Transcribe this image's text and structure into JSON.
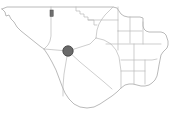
{
  "map": {
    "title": "Locator map",
    "type": "administrative-boundary-locator-map",
    "width": 171,
    "height": 118,
    "background_color": "#ffffff",
    "boundary_color": "#b9b9b9",
    "outer_boundary_color": "#a8a8a8",
    "marker_dot": {
      "name": "highlighted-location-dot",
      "color": "#6a6a6a",
      "outline_color": "#3d3d3d",
      "cx": 68,
      "cy": 51,
      "r": 5.2
    },
    "marker_rect": {
      "name": "highlighted-location-rect",
      "color": "#6f6f6f",
      "outline_color": "#4a4a4a",
      "x": 50,
      "y": 10,
      "width": 3.2,
      "height": 6.4
    },
    "outer_outline": "M 2,9 L 5,12 L 6,16 L 9,15 L 11,19 L 14,22 L 17,27 L 21,31 L 26,35 L 31,39 L 36,43 L 41,47 L 44,49 L 48,55 L 52,62 L 56,70 L 59,78 L 62,86 L 65,93 L 69,99 L 74,104 L 80,107 L 87,108 L 94,107 L 100,104 L 106,100 L 112,96 L 117,92 L 121,88 L 125,85 L 129,84 L 133,84 L 137,85 L 141,86 L 145,86 L 149,85 L 152,83 L 155,80 L 157,76 L 158,71 L 159,65 L 160,60 L 161,55 L 163,52 L 165,50 L 167,48 L 168,45 L 168,41 L 167,38 L 166,35 L 164,33 L 161,32 L 158,32 L 155,32 L 152,32 L 149,32 L 146,31 L 144,29 L 143,26 L 143,22 L 143,18 L 140,17 L 136,17 L 132,17 L 128,17 L 124,16 L 121,14 L 119,11 L 117,8 L 113,7 L 108,7 L 102,7 L 96,7 L 90,7 L 84,7 L 78,7 L 72,7 L 66,7 L 60,7 L 54,7 L 48,7 L 42,7 L 36,7 L 30,7 L 24,7 L 18,7 L 12,7 L 7,7 L 2,9 Z",
    "internal_boundaries": [
      "M 51,7 L 51,36 L 50,41 L 48,45 L 45,48 L 44,49",
      "M 44,49 L 68,51 L 90,44 L 96,38",
      "M 68,51 L 66,62 L 64,74 L 63,86 L 63,96",
      "M 68,51 L 80,62 L 92,72 L 104,82 L 112,89",
      "M 96,38 L 97,30 L 99,24 L 102,19 L 105,15 L 108,12 L 111,9 L 113,7",
      "M 96,38 L 104,40 L 111,44 L 116,50 L 119,57 L 120,64 L 121,71 L 121,78 L 121,84 L 121,88",
      "M 76,7 L 76,11 L 80,11 L 80,14 L 84,14 L 84,17 L 88,17 L 88,20 L 94,20 L 94,25 L 97,25",
      "M 88,20 L 94,20 L 100,20 L 106,20 L 112,20 L 118,20",
      "M 118,7 L 118,20 L 118,26 L 118,31",
      "M 118,31 L 124,31 L 130,31 L 136,31 L 142,31",
      "M 130,17 L 130,31 L 130,37 L 130,43",
      "M 143,22 L 143,31 L 143,38 L 143,44",
      "M 118,31 L 118,37 L 118,44 L 118,50",
      "M 106,44 L 112,44 L 118,44 L 124,44 L 130,44 L 136,44 L 143,44 L 150,44 L 156,44 L 161,44",
      "M 121,60 L 128,60 L 134,60 L 140,60 L 146,60 L 152,60 L 157,59",
      "M 134,44 L 134,52 L 134,60 L 134,68 L 134,76 L 134,84",
      "M 121,71 L 127,71 L 133,71 L 139,71 L 145,71",
      "M 145,60 L 145,66 L 145,71 L 145,78 L 145,84"
    ]
  }
}
